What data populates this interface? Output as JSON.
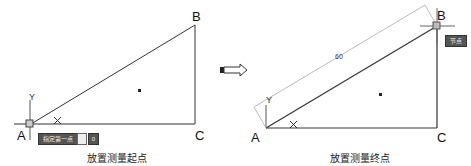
{
  "left_panel": {
    "vertices": {
      "A": "A",
      "B": "B",
      "C": "C"
    },
    "axis_x": "X",
    "axis_y": "Y",
    "tooltip": "指定第一点",
    "input_value": "",
    "input2_value": "0",
    "caption": "放置测量起点"
  },
  "right_panel": {
    "vertices": {
      "A": "A",
      "B": "B",
      "C": "C"
    },
    "axis_x": "X",
    "axis_y": "Y",
    "dimension_value": "60",
    "tooltip": "节点",
    "caption": "放置测量终点"
  },
  "arrow": {
    "icon": "right-arrow-icon"
  }
}
